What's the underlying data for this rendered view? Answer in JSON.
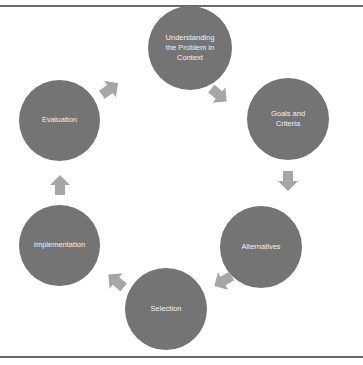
{
  "diagram": {
    "type": "cycle",
    "colors": {
      "node_fill": "#747474",
      "node_text": "#f2f2f2",
      "arrow_fill": "#a6a6a6",
      "rule": "#6b6b6b"
    },
    "nodes": [
      {
        "id": "understanding",
        "label_lines": [
          "Understanding",
          "the Problem in",
          "Context"
        ]
      },
      {
        "id": "goals",
        "label_lines": [
          "Goals and",
          "Criteria"
        ]
      },
      {
        "id": "alternatives",
        "label_lines": [
          "Alternatives"
        ]
      },
      {
        "id": "selection",
        "label_lines": [
          "Selection"
        ]
      },
      {
        "id": "implementation",
        "label_lines": [
          "Implementation"
        ]
      },
      {
        "id": "evaluation",
        "label_lines": [
          "Evaluation"
        ]
      }
    ],
    "edges": [
      {
        "from": "understanding",
        "to": "goals"
      },
      {
        "from": "goals",
        "to": "alternatives"
      },
      {
        "from": "alternatives",
        "to": "selection"
      },
      {
        "from": "selection",
        "to": "implementation"
      },
      {
        "from": "implementation",
        "to": "evaluation"
      },
      {
        "from": "evaluation",
        "to": "understanding"
      }
    ]
  }
}
